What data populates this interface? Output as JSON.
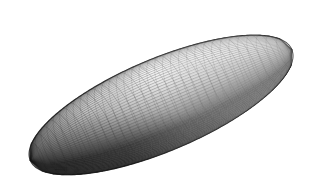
{
  "figure": {
    "panel_label": "(b)",
    "caption_position": "top-left",
    "background_color": "#ffffff",
    "width": 317,
    "height": 194
  },
  "chart_data": {
    "type": "scatter",
    "title": "(b)",
    "subtitle": "",
    "xlabel": "",
    "ylabel": "",
    "render_style": "wireframe-mesh-shaded",
    "object": "prolate-ellipsoid",
    "geometry": {
      "center_x": 161,
      "center_y": 105,
      "semi_major_axis": 142,
      "semi_minor_axis": 46,
      "tilt_degrees": -23,
      "aspect_ratio": 3.09,
      "extent_left": 25,
      "extent_right": 298,
      "extent_top": 36,
      "extent_bottom": 176
    },
    "mesh": {
      "u_divisions": 96,
      "v_divisions": 34,
      "line_color": "#2b2b2b",
      "line_width": 0.35,
      "fill_light": "#efefef",
      "fill_mid": "#b8b8b8",
      "fill_dark": "#6e6e6e",
      "silhouette_color": "#1a1a1a"
    },
    "shading": {
      "light_direction": "upper-left",
      "highlight_region": "upper-center",
      "shadow_region": "lower-left-and-lower-rim",
      "min_gray": "#5a5a5a",
      "max_gray": "#f2f2f2"
    },
    "grid": false,
    "legend": null,
    "axis_visible": false
  }
}
